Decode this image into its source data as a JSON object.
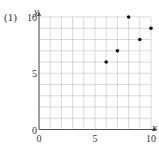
{
  "problem_label": "(1)",
  "chart_data": {
    "type": "scatter",
    "title": "",
    "xlabel": "x",
    "ylabel": "y",
    "xlim": [
      0,
      10
    ],
    "ylim": [
      0,
      10
    ],
    "x_ticks": [
      "0",
      "5",
      "10"
    ],
    "y_ticks": [
      "0",
      "5",
      "10"
    ],
    "grid": true,
    "grid_step": 1,
    "legend": null,
    "series": [
      {
        "name": "points",
        "points": [
          {
            "x": 6,
            "y": 6
          },
          {
            "x": 7,
            "y": 7
          },
          {
            "x": 8,
            "y": 10
          },
          {
            "x": 9,
            "y": 8
          },
          {
            "x": 10,
            "y": 9
          }
        ]
      }
    ]
  },
  "colors": {
    "grid": "#c8c8c8",
    "axis": "#555555",
    "point": "#111111",
    "text": "#333333"
  }
}
